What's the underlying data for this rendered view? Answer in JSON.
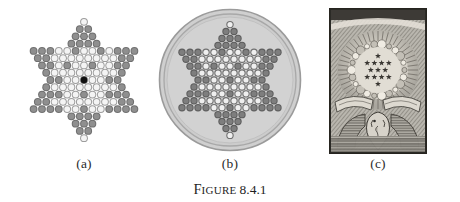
{
  "figure": {
    "caption_prefix_first": "F",
    "caption_prefix_rest": "IGURE",
    "caption_number": "8.4.1",
    "caption_full": "FIGURE 8.4.1",
    "background_color": "#ffffff"
  },
  "panels": [
    {
      "id": "a",
      "sublabel": "(a)",
      "title": "chinese-checkers-star-board",
      "description": "Hexagram peg board: triangular lattice of holes forming a six-pointed star, with one black peg at the centre.",
      "colors": {
        "hole_light": "#f2f2f2",
        "hole_light_ring": "#9a9a9a",
        "hole_dark": "#8d8d8d",
        "hole_dark_ring": "#6f6f6f",
        "center_peg": "#111111"
      },
      "lattice": {
        "rows": 17,
        "max_row_width": 13,
        "star_points": 6,
        "hole_diameter_px": 7.6,
        "center_marker": "black-peg"
      }
    },
    {
      "id": "b",
      "sublabel": "(b)",
      "title": "circular-chinese-checkers-board",
      "description": "Round board with a double ring rim; the same hexagram lattice is inset, with the six star points shaded darker.",
      "colors": {
        "board_fill": "#cfcfcf",
        "rim_outer": "#9b9b9b",
        "rim_inner": "#b4b4b4",
        "hole_light": "#efefef",
        "hole_dark": "#7e7e7e",
        "hole_ring": "#6c6c6c"
      },
      "circle": {
        "diameter_px": 140,
        "rings": 2
      }
    },
    {
      "id": "c",
      "sublabel": "(c)",
      "title": "dollar-bill-great-seal-detail",
      "description": "Grayscale engraving detail from the reverse of a US one dollar bill: thirteen stars above the eagle arranged in a hexagram, surrounded by a glory of clouds and rays, with ribbon scrollwork and the eagle's head below.",
      "colors": {
        "paper": "#b9b6ae",
        "ink_dark": "#3a3733",
        "ink_mid": "#6e6a63",
        "highlight": "#ddd9d0",
        "frame": "#2e2c29"
      },
      "stars": {
        "count": 13,
        "arrangement": "hexagram",
        "rows": [
          1,
          4,
          3,
          4,
          1
        ]
      }
    }
  ]
}
